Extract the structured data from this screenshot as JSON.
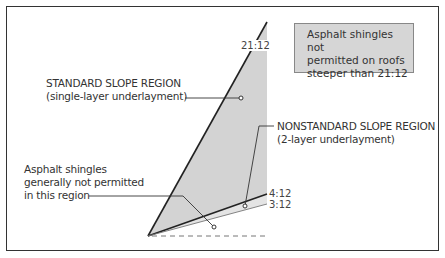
{
  "diagram": {
    "slope_labels": {
      "steep": "21:12",
      "standard_min": "4:12",
      "nonstandard_min": "3:12"
    },
    "regions": {
      "standard": {
        "line1": "STANDARD SLOPE REGION",
        "line2": "(single-layer underlayment)"
      },
      "nonstandard": {
        "line1": "NONSTANDARD SLOPE REGION",
        "line2": "(2-layer underlayment)"
      },
      "low": {
        "line1": "Asphalt shingles",
        "line2": "generally not permitted",
        "line3": "in this region"
      }
    },
    "note": {
      "line1": "Asphalt shingles not",
      "line2": "permitted on roofs",
      "line3": "steeper than 21:12"
    },
    "colors": {
      "region_fill": "#d3d3d3",
      "note_fill": "#d6d6d6",
      "line": "#222222"
    }
  }
}
